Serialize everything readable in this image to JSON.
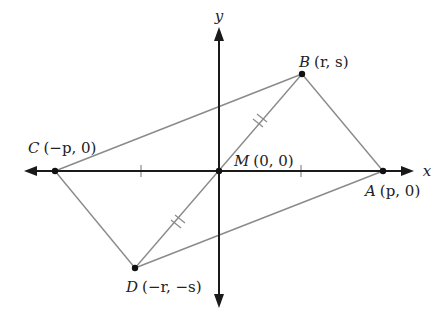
{
  "diagram": {
    "type": "coordinate-geometry",
    "axes": {
      "x_label": "x",
      "y_label": "y",
      "axis_color": "#1a1a1a"
    },
    "segment_color": "#8a8a8a",
    "points": [
      {
        "id": "A",
        "name": "A",
        "coords": "(p, 0)",
        "px": [
          383,
          171
        ]
      },
      {
        "id": "B",
        "name": "B",
        "coords": "(r, s)",
        "px": [
          302,
          74
        ]
      },
      {
        "id": "C",
        "name": "C",
        "coords": "(−p, 0)",
        "px": [
          55,
          171
        ]
      },
      {
        "id": "D",
        "name": "D",
        "coords": "(−r, −s)",
        "px": [
          135,
          268
        ]
      },
      {
        "id": "M",
        "name": "M",
        "coords": "(0, 0)",
        "px": [
          219,
          171
        ]
      }
    ],
    "segments": [
      "AB",
      "BC",
      "CD",
      "DA",
      "CA",
      "BD"
    ],
    "congruence_marks": [
      {
        "segment": "CM",
        "ticks": 1
      },
      {
        "segment": "MA",
        "ticks": 1
      },
      {
        "segment": "MB",
        "ticks": 2
      },
      {
        "segment": "MD",
        "ticks": 2
      }
    ]
  },
  "labels": {
    "A": {
      "name": "A",
      "coords": "(p, 0)"
    },
    "B": {
      "name": "B",
      "coords": "(r, s)"
    },
    "C": {
      "name": "C",
      "coords": "(−p, 0)"
    },
    "D": {
      "name": "D",
      "coords": "(−r, −s)"
    },
    "M": {
      "name": "M",
      "coords": "(0, 0)"
    },
    "x_axis": "x",
    "y_axis": "y"
  }
}
